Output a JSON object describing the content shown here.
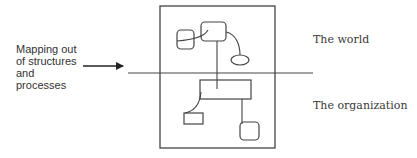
{
  "diagram": {
    "left_label": {
      "lines": [
        "Mapping out",
        "of structures",
        "and",
        "processes"
      ]
    },
    "zones": {
      "upper": "The world",
      "lower": "The organization"
    },
    "colors": {
      "stroke": "#444444",
      "text": "#333333",
      "background": "#ffffff"
    },
    "elements": {
      "frame": {
        "x": 160,
        "y": 6,
        "width": 115,
        "height": 142
      },
      "divider_line": {
        "x1": 128,
        "y1": 73,
        "x2": 313,
        "y2": 73
      },
      "arrow": {
        "x1": 83,
        "y1": 66,
        "x2": 123,
        "y2": 66
      },
      "upper_shapes": [
        {
          "type": "rounded-rect",
          "x": 177,
          "y": 30,
          "width": 17,
          "height": 19
        },
        {
          "type": "rounded-rect",
          "x": 201,
          "y": 22,
          "width": 25,
          "height": 19
        },
        {
          "type": "ellipse",
          "cx": 240,
          "cy": 60,
          "rx": 9,
          "ry": 5
        }
      ],
      "lower_shapes": [
        {
          "type": "rect",
          "x": 200,
          "y": 80,
          "width": 51,
          "height": 19
        },
        {
          "type": "rect",
          "x": 184,
          "y": 113,
          "width": 19,
          "height": 11
        },
        {
          "type": "rounded-rect",
          "x": 240,
          "y": 122,
          "width": 19,
          "height": 18
        }
      ]
    }
  }
}
